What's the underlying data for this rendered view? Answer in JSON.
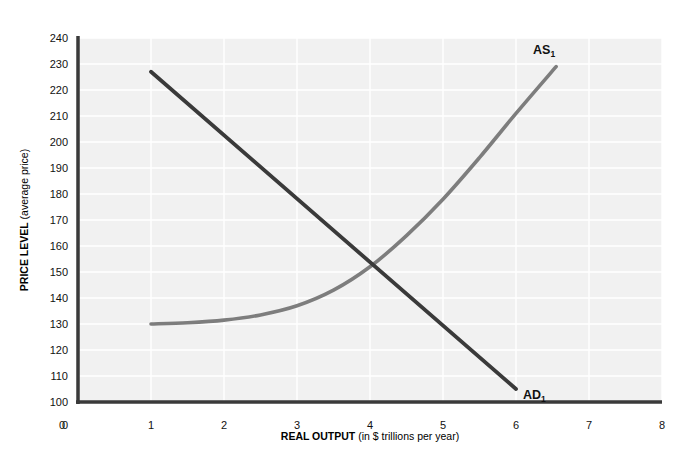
{
  "chart_data": {
    "type": "line",
    "title": "",
    "xlabel_bold": "REAL OUTPUT",
    "xlabel_normal": " (in $ trillions per year)",
    "ylabel_bold": "PRICE LEVEL",
    "ylabel_normal": " (average price)",
    "xlim": [
      0,
      8
    ],
    "ylim": [
      100,
      240
    ],
    "y_origin_label": "0",
    "grid": true,
    "legend": "none",
    "x_ticks": [
      "0",
      "1",
      "2",
      "3",
      "4",
      "5",
      "6",
      "7",
      "8"
    ],
    "x_tick_values": [
      0,
      1,
      2,
      3,
      4,
      5,
      6,
      7,
      8
    ],
    "y_ticks": [
      "100",
      "110",
      "120",
      "130",
      "140",
      "150",
      "160",
      "170",
      "180",
      "190",
      "200",
      "210",
      "220",
      "230",
      "240"
    ],
    "y_tick_values": [
      100,
      110,
      120,
      130,
      140,
      150,
      160,
      170,
      180,
      190,
      200,
      210,
      220,
      230,
      240
    ],
    "series": [
      {
        "name": "AD1",
        "label_main": "AD",
        "label_sub": "1",
        "color": "#3a3a3a",
        "shape": "straight-downward-sloping",
        "points": [
          {
            "x": 1.0,
            "y": 227
          },
          {
            "x": 6.0,
            "y": 105
          }
        ]
      },
      {
        "name": "AS1",
        "label_main": "AS",
        "label_sub": "1",
        "color": "#7d7d7d",
        "shape": "upward-sloping-convex-curve",
        "points": [
          {
            "x": 1.0,
            "y": 130
          },
          {
            "x": 1.5,
            "y": 130.5
          },
          {
            "x": 2.0,
            "y": 131.5
          },
          {
            "x": 2.5,
            "y": 133.5
          },
          {
            "x": 3.0,
            "y": 137
          },
          {
            "x": 3.5,
            "y": 143
          },
          {
            "x": 4.0,
            "y": 152
          },
          {
            "x": 4.5,
            "y": 164
          },
          {
            "x": 5.0,
            "y": 178
          },
          {
            "x": 5.5,
            "y": 194
          },
          {
            "x": 6.0,
            "y": 211
          },
          {
            "x": 6.55,
            "y": 229
          }
        ]
      }
    ],
    "annotations": [
      {
        "name": "equilibrium-intersection",
        "x": 4.0,
        "y": 152
      }
    ],
    "colors": {
      "plot_background": "#f1f1f1",
      "gridline": "#ffffff",
      "axis_line": "#3a3a3a",
      "page_background": "#ffffff",
      "ad_curve": "#3a3a3a",
      "as_curve": "#7d7d7d"
    }
  }
}
